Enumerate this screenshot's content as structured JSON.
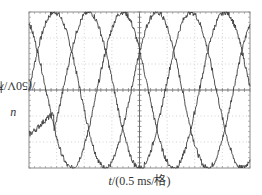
{
  "chart_data": {
    "type": "line",
    "title": "",
    "xlabel": "t/(0.5 ms/格)",
    "xlabel_var": "t",
    "xlabel_unit": "/(0.5 ms/格)",
    "ylabel": "u/(50V/格)",
    "ylabel_var": "u",
    "ylabel_unit": "/(50V/格)",
    "grid": true,
    "grid_style": "dotted oscilloscope graticule",
    "x_divisions": 8,
    "y_divisions": 6,
    "x_scale": "0.5 ms per division",
    "y_scale": "50 V per division",
    "xlim_div": [
      0,
      8
    ],
    "ylim_div": [
      -3,
      3
    ],
    "legend": "none",
    "x": [
      0,
      0.5,
      1.0,
      1.5,
      2.0,
      2.5,
      3.0,
      3.5,
      4.0,
      4.5,
      5.0,
      5.5,
      6.0,
      6.5,
      7.0,
      7.5,
      8.0
    ],
    "series": [
      {
        "name": "phase A",
        "amplitude_div": 3.0,
        "period_div": 3.7,
        "phase_deg": 0,
        "values": [
          0.0,
          2.2,
          3.0,
          1.2,
          -1.6,
          -3.0,
          -1.9,
          0.6,
          2.6,
          2.8,
          0.5,
          -2.0,
          -3.0,
          -1.3,
          1.4,
          2.9,
          2.1
        ]
      },
      {
        "name": "phase B",
        "amplitude_div": 3.0,
        "period_div": 3.7,
        "phase_deg": 120,
        "values": [
          1.5,
          -0.9,
          -2.9,
          -2.6,
          -0.3,
          2.2,
          3.0,
          1.2,
          -1.6,
          -3.0,
          -1.9,
          0.6,
          2.6,
          2.8,
          0.5,
          -2.0,
          -3.0
        ]
      },
      {
        "name": "phase C",
        "amplitude_div": 3.0,
        "period_div": 3.7,
        "phase_deg": 240,
        "values": [
          -1.5,
          -1.3,
          -0.1,
          1.4,
          1.9,
          0.8,
          -1.1,
          -1.8,
          -1.0,
          0.2,
          1.4,
          1.4,
          0.4,
          -1.5,
          -1.9,
          -0.9,
          0.9
        ]
      }
    ]
  },
  "labels": {
    "y_var": "u",
    "y_unit": "/(50V/格)",
    "x_var": "t",
    "x_unit": "/(0.5 ms/格)"
  }
}
